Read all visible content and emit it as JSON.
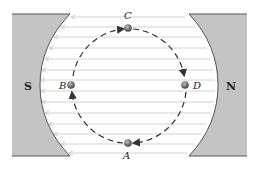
{
  "diagram": {
    "poles": {
      "left": {
        "label": "S"
      },
      "right": {
        "label": "N"
      }
    },
    "points": [
      {
        "id": "A",
        "label": "A"
      },
      {
        "id": "B",
        "label": "B"
      },
      {
        "id": "C",
        "label": "C"
      },
      {
        "id": "D",
        "label": "D"
      }
    ],
    "field_line_count": 14,
    "field_direction": "N to S (right to left)",
    "motion": "clockwise dashed circular path through C, D, A, B",
    "colors": {
      "pole_fill": "#c4c4c4",
      "pole_edge": "#555555",
      "field_line": "#cfcfcf",
      "path": "#333333",
      "particle": "#5a5a5a"
    }
  }
}
